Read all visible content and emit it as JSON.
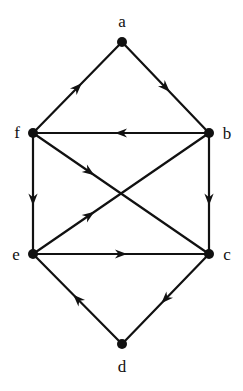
{
  "figure": {
    "kind": "directed-graph-diagram",
    "background_color": "#ffffff",
    "ink_color": "#111111",
    "width": 243,
    "height": 391
  },
  "chart_data": {
    "type": "diagram",
    "subtype": "directed-graph",
    "title": "",
    "xlabel": "",
    "ylabel": "",
    "grid": false,
    "legend": false,
    "node_radius": 5,
    "edge_width": 2.2,
    "arrow_size": 11,
    "nodes": [
      {
        "id": "a",
        "label": "a",
        "x": 122,
        "y": 42,
        "label_x": 122,
        "label_y": 21
      },
      {
        "id": "b",
        "label": "b",
        "x": 209,
        "y": 133,
        "label_x": 227,
        "label_y": 133
      },
      {
        "id": "c",
        "label": "c",
        "x": 209,
        "y": 254,
        "label_x": 227,
        "label_y": 254
      },
      {
        "id": "d",
        "label": "d",
        "x": 122,
        "y": 344,
        "label_x": 122,
        "label_y": 366
      },
      {
        "id": "e",
        "label": "e",
        "x": 33,
        "y": 254,
        "label_x": 16,
        "label_y": 254
      },
      {
        "id": "f",
        "label": "f",
        "x": 33,
        "y": 133,
        "label_x": 17,
        "label_y": 132
      }
    ],
    "edges": [
      {
        "id": "f-a",
        "from": "f",
        "to": "a",
        "directed": true,
        "arrow_at": 0.5
      },
      {
        "id": "a-b",
        "from": "a",
        "to": "b",
        "directed": true,
        "arrow_at": 0.5
      },
      {
        "id": "b-f",
        "from": "b",
        "to": "f",
        "directed": true,
        "arrow_at": 0.5
      },
      {
        "id": "f-e",
        "from": "f",
        "to": "e",
        "directed": true,
        "arrow_at": 0.55
      },
      {
        "id": "b-c",
        "from": "b",
        "to": "c",
        "directed": true,
        "arrow_at": 0.55
      },
      {
        "id": "f-c",
        "from": "f",
        "to": "c",
        "directed": true,
        "arrow_at": 0.32
      },
      {
        "id": "e-b",
        "from": "e",
        "to": "b",
        "directed": true,
        "arrow_at": 0.32
      },
      {
        "id": "e-c",
        "from": "e",
        "to": "c",
        "directed": true,
        "arrow_at": 0.5
      },
      {
        "id": "c-d",
        "from": "c",
        "to": "d",
        "directed": true,
        "arrow_at": 0.5
      },
      {
        "id": "d-e",
        "from": "d",
        "to": "e",
        "directed": true,
        "arrow_at": 0.5
      }
    ]
  }
}
